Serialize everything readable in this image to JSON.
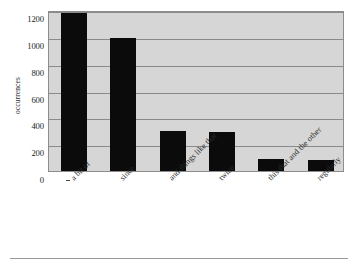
{
  "chart_data": {
    "type": "bar",
    "title": "",
    "subtitle": "",
    "xlabel": "",
    "ylabel": "occurrences",
    "categories": [
      "a bit of",
      "since",
      "and things like that",
      "twice",
      "this that and the other",
      "regularly"
    ],
    "values": [
      1180,
      990,
      300,
      290,
      90,
      80
    ],
    "ylim": [
      0,
      1200
    ],
    "ytick_labels": [
      "0",
      "200",
      "400",
      "600",
      "800",
      "1000",
      "1200"
    ],
    "ytick_values": [
      0,
      200,
      400,
      600,
      800,
      1000,
      1200
    ],
    "grid": "horizontal",
    "legend": "none",
    "annotations": [],
    "style": {
      "bar_color": "#0b0b0b",
      "plot_background": "#d6d6d6",
      "gridline_color": "#8a8a8a",
      "axis_border_color": "#8d8d8d",
      "page_background": "#ffffff",
      "text_color": "#2b2b2b",
      "xtick_label_rotation": "-45"
    }
  },
  "footer": {
    "rule_color": "#9a9a9a"
  }
}
